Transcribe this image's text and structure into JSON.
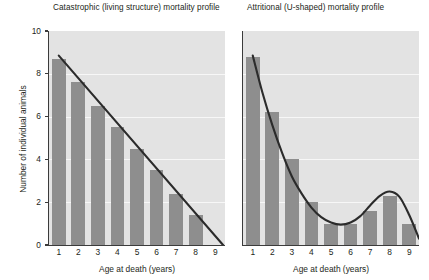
{
  "figure": {
    "background": "#ffffff",
    "plot_background": "#e3e3e3",
    "bar_color": "#8e8e8e",
    "curve_color": "#2b2b2b",
    "gridline_color": "#f7f7f7",
    "axis_color": "#3b3b3b"
  },
  "shared": {
    "xlabel": "Age at death (years)",
    "ylabel": "Number of individual animals",
    "xticks": [
      "1",
      "2",
      "3",
      "4",
      "5",
      "6",
      "7",
      "8",
      "9"
    ],
    "yticks": [
      "0",
      "2",
      "4",
      "6",
      "8",
      "10"
    ]
  },
  "chart_data": [
    {
      "type": "bar",
      "title": "Catastrophic (living structure) mortality profile",
      "xlabel": "Age at death (years)",
      "ylabel": "Number of individual animals",
      "categories": [
        "1",
        "2",
        "3",
        "4",
        "5",
        "6",
        "7",
        "8",
        "9"
      ],
      "values": [
        8.7,
        7.6,
        6.5,
        5.5,
        4.5,
        3.5,
        2.4,
        1.4,
        0.0
      ],
      "xlim": [
        0.5,
        9.5
      ],
      "ylim": [
        0,
        10
      ],
      "ytick_values": [
        0,
        2,
        4,
        6,
        8,
        10
      ],
      "grid": true,
      "legend": "none",
      "overlay": {
        "type": "line",
        "name": "catastrophic-trend",
        "description": "straight declining line",
        "x": [
          1.0,
          9.4
        ],
        "y": [
          8.85,
          0.0
        ]
      }
    },
    {
      "type": "bar",
      "title": "Attritional (U-shaped) mortality profile",
      "xlabel": "Age at death (years)",
      "ylabel": "Number of individual animals",
      "categories": [
        "1",
        "2",
        "3",
        "4",
        "5",
        "6",
        "7",
        "8",
        "9"
      ],
      "values": [
        8.8,
        6.2,
        4.0,
        2.0,
        1.0,
        1.0,
        1.6,
        2.3,
        1.0
      ],
      "xlim": [
        0.5,
        9.5
      ],
      "ylim": [
        0,
        10
      ],
      "ytick_values": [
        0,
        2,
        4,
        6,
        8,
        10
      ],
      "grid": true,
      "legend": "none",
      "overlay": {
        "type": "line",
        "name": "attritional-trend",
        "description": "U-shaped curve: steep decay to trough near age 5.5, secondary peak at age 8, then decline",
        "x": [
          1.0,
          1.5,
          2.0,
          2.5,
          3.0,
          3.5,
          4.0,
          4.5,
          5.0,
          5.5,
          6.0,
          6.5,
          7.0,
          7.5,
          8.0,
          8.5,
          9.0,
          9.5
        ],
        "y": [
          8.85,
          7.1,
          5.6,
          4.3,
          3.2,
          2.4,
          1.75,
          1.3,
          1.05,
          0.95,
          1.05,
          1.35,
          1.85,
          2.3,
          2.5,
          2.25,
          1.4,
          0.3
        ]
      }
    }
  ]
}
